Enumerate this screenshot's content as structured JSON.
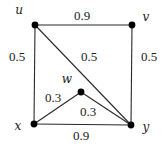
{
  "diagram": {
    "type": "weighted-undirected-graph",
    "nodes": [
      {
        "id": "u",
        "label": "u"
      },
      {
        "id": "v",
        "label": "v"
      },
      {
        "id": "w",
        "label": "w"
      },
      {
        "id": "x",
        "label": "x"
      },
      {
        "id": "y",
        "label": "y"
      }
    ],
    "edges": [
      {
        "id": "u-v",
        "from": "u",
        "to": "v",
        "weight": "0.9"
      },
      {
        "id": "u-x",
        "from": "u",
        "to": "x",
        "weight": "0.5"
      },
      {
        "id": "v-y",
        "from": "v",
        "to": "y",
        "weight": "0.5"
      },
      {
        "id": "u-y",
        "from": "u",
        "to": "y",
        "weight": "0.5"
      },
      {
        "id": "x-w",
        "from": "x",
        "to": "w",
        "weight": "0.3"
      },
      {
        "id": "w-y",
        "from": "w",
        "to": "y",
        "weight": "0.3"
      },
      {
        "id": "x-y",
        "from": "x",
        "to": "y",
        "weight": "0.9"
      }
    ]
  }
}
